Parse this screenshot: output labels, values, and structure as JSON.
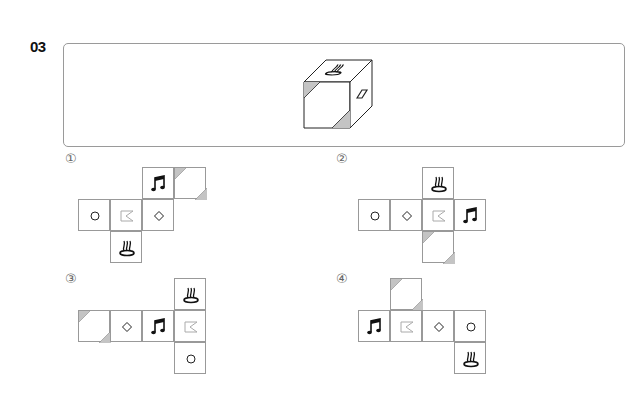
{
  "question": {
    "number": "03",
    "cube": {
      "faces": {
        "top": "spa-icon",
        "front": "diagonal-stripe",
        "right": "rectangle"
      }
    }
  },
  "options": [
    {
      "label": "①",
      "left": 65,
      "top": 155,
      "cells": [
        {
          "x": 77,
          "y": 167,
          "icon": "music"
        },
        {
          "x": 109,
          "y": 167,
          "icon": "stripe"
        },
        {
          "x": 13,
          "y": 199,
          "icon": "circle"
        },
        {
          "x": 45,
          "y": 199,
          "icon": "flag"
        },
        {
          "x": 77,
          "y": 199,
          "icon": "diamond"
        },
        {
          "x": 45,
          "y": 231,
          "icon": "spa"
        }
      ]
    },
    {
      "label": "②",
      "left": 336,
      "top": 155,
      "cells": [
        {
          "x": 86,
          "y": 167,
          "icon": "spa"
        },
        {
          "x": 22,
          "y": 199,
          "icon": "circle"
        },
        {
          "x": 54,
          "y": 199,
          "icon": "diamond"
        },
        {
          "x": 86,
          "y": 199,
          "icon": "flag"
        },
        {
          "x": 118,
          "y": 199,
          "icon": "music"
        },
        {
          "x": 86,
          "y": 231,
          "icon": "stripe"
        }
      ]
    },
    {
      "label": "③",
      "left": 65,
      "top": 275,
      "cells": [
        {
          "x": 109,
          "y": 278,
          "icon": "spa"
        },
        {
          "x": 13,
          "y": 310,
          "icon": "stripe"
        },
        {
          "x": 45,
          "y": 310,
          "icon": "diamond"
        },
        {
          "x": 77,
          "y": 310,
          "icon": "music"
        },
        {
          "x": 109,
          "y": 310,
          "icon": "flag"
        },
        {
          "x": 109,
          "y": 342,
          "icon": "circle"
        }
      ]
    },
    {
      "label": "④",
      "left": 336,
      "top": 275,
      "cells": [
        {
          "x": 54,
          "y": 278,
          "icon": "stripe"
        },
        {
          "x": 22,
          "y": 310,
          "icon": "music"
        },
        {
          "x": 54,
          "y": 310,
          "icon": "flag"
        },
        {
          "x": 86,
          "y": 310,
          "icon": "diamond"
        },
        {
          "x": 118,
          "y": 310,
          "icon": "circle"
        },
        {
          "x": 118,
          "y": 342,
          "icon": "spa"
        }
      ]
    }
  ]
}
